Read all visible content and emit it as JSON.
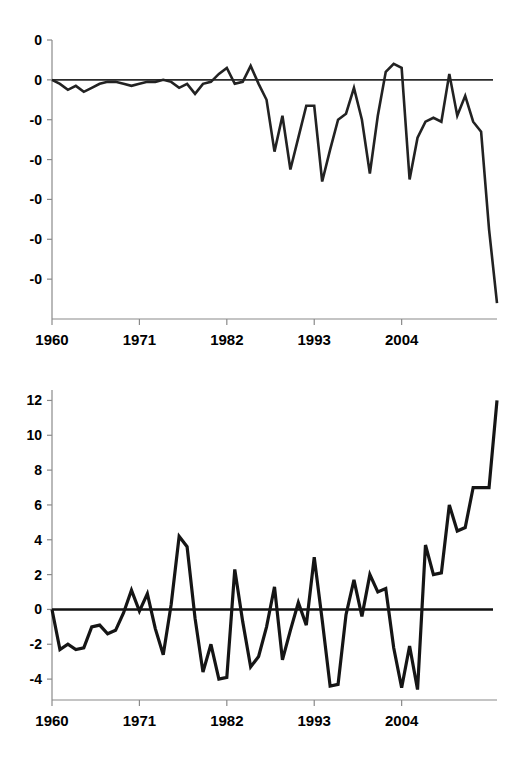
{
  "page": {
    "background_color": "#ffffff",
    "line_color": "#222222",
    "axis_color": "#8a8a8a",
    "text_color": "#000000"
  },
  "chart_data": [
    {
      "id": "top",
      "type": "line",
      "title": "",
      "subtitle": "",
      "xlabel": "",
      "ylabel": "",
      "grid": false,
      "legend": "none",
      "zero_reference_line": true,
      "xlim": [
        1960,
        2016
      ],
      "ylim": [
        -1.2,
        0.2
      ],
      "y_tick_labels": [
        "0",
        "0",
        "-0",
        "-0",
        "-0",
        "-0",
        "-0"
      ],
      "y_tick_values": [
        0.2,
        0.0,
        -0.2,
        -0.4,
        -0.6,
        -0.8,
        -1.0
      ],
      "x_tick_labels": [
        "1960",
        "1971",
        "1982",
        "1993",
        "2004"
      ],
      "x_tick_values": [
        1960,
        1971,
        1982,
        1993,
        2004
      ],
      "x": [
        1960,
        1961,
        1962,
        1963,
        1964,
        1965,
        1966,
        1967,
        1968,
        1969,
        1970,
        1971,
        1972,
        1973,
        1974,
        1975,
        1976,
        1977,
        1978,
        1979,
        1980,
        1981,
        1982,
        1983,
        1984,
        1985,
        1986,
        1987,
        1988,
        1989,
        1990,
        1991,
        1992,
        1993,
        1994,
        1995,
        1996,
        1997,
        1998,
        1999,
        2000,
        2001,
        2002,
        2003,
        2004,
        2005,
        2006,
        2007,
        2008,
        2009,
        2010,
        2011,
        2012,
        2013,
        2014,
        2015,
        2016
      ],
      "values": [
        0.0,
        -0.02,
        -0.05,
        -0.03,
        -0.06,
        -0.04,
        -0.02,
        -0.01,
        -0.01,
        -0.02,
        -0.03,
        -0.02,
        -0.01,
        -0.01,
        0.0,
        -0.01,
        -0.04,
        -0.02,
        -0.07,
        -0.02,
        -0.01,
        0.03,
        0.06,
        -0.02,
        -0.01,
        0.07,
        -0.02,
        -0.1,
        -0.36,
        -0.18,
        -0.45,
        -0.29,
        -0.13,
        -0.13,
        -0.51,
        -0.35,
        -0.2,
        -0.17,
        -0.04,
        -0.2,
        -0.47,
        -0.18,
        0.04,
        0.08,
        0.06,
        -0.5,
        -0.29,
        -0.21,
        -0.19,
        -0.21,
        0.03,
        -0.18,
        -0.08,
        -0.21,
        -0.26,
        -0.75,
        -1.12
      ],
      "annotations": []
    },
    {
      "id": "bottom",
      "type": "line",
      "title": "",
      "subtitle": "",
      "xlabel": "",
      "ylabel": "",
      "grid": false,
      "legend": "none",
      "zero_reference_line": true,
      "xlim": [
        1960,
        2016
      ],
      "ylim": [
        -5.2,
        12.6
      ],
      "y_tick_labels": [
        "12",
        "10",
        "8",
        "6",
        "4",
        "2",
        "0",
        "-2",
        "-4"
      ],
      "y_tick_values": [
        12,
        10,
        8,
        6,
        4,
        2,
        0,
        -2,
        -4
      ],
      "x_tick_labels": [
        "1960",
        "1971",
        "1982",
        "1993",
        "2004"
      ],
      "x_tick_values": [
        1960,
        1971,
        1982,
        1993,
        2004
      ],
      "x": [
        1960,
        1961,
        1962,
        1963,
        1964,
        1965,
        1966,
        1967,
        1968,
        1969,
        1970,
        1971,
        1972,
        1973,
        1974,
        1975,
        1976,
        1977,
        1978,
        1979,
        1980,
        1981,
        1982,
        1983,
        1984,
        1985,
        1986,
        1987,
        1988,
        1989,
        1990,
        1991,
        1992,
        1993,
        1994,
        1995,
        1996,
        1997,
        1998,
        1999,
        2000,
        2001,
        2002,
        2003,
        2004,
        2005,
        2006,
        2007,
        2008,
        2009,
        2010,
        2011,
        2012,
        2013,
        2014,
        2015,
        2016
      ],
      "values": [
        0.0,
        -2.3,
        -2.0,
        -2.3,
        -2.2,
        -1.0,
        -0.9,
        -1.4,
        -1.2,
        -0.2,
        1.1,
        -0.1,
        0.9,
        -1.1,
        -2.6,
        0.3,
        4.2,
        3.6,
        -0.5,
        -3.6,
        -2.0,
        -4.0,
        -3.9,
        2.3,
        -0.7,
        -3.3,
        -2.7,
        -1.0,
        1.3,
        -2.9,
        -1.2,
        0.4,
        -0.9,
        3.0,
        -0.6,
        -4.4,
        -4.3,
        -0.3,
        1.7,
        -0.4,
        2.0,
        1.0,
        1.2,
        -2.2,
        -4.5,
        -2.1,
        -4.6,
        3.7,
        2.0,
        2.1,
        6.0,
        4.5,
        4.7,
        7.0,
        7.0,
        7.0,
        12.0
      ],
      "annotations": []
    }
  ]
}
